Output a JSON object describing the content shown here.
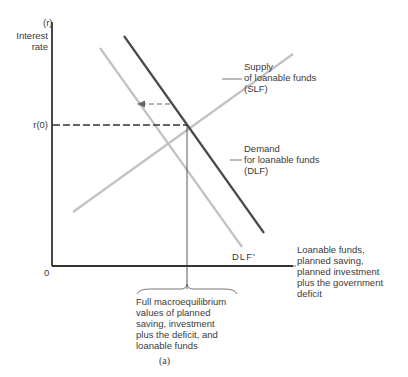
{
  "axes": {
    "y_symbol": "(r)",
    "y_label_line1": "Interest",
    "y_label_line2": "rate",
    "origin": "0",
    "x_label_lines": [
      "Loanable funds,",
      "planned saving,",
      "planned investment",
      "plus the government",
      "deficit"
    ],
    "r0_label": "r(0)"
  },
  "curves": {
    "supply": {
      "lines": [
        "Supply",
        "of loanable funds",
        "(SLF)"
      ]
    },
    "demand": {
      "lines": [
        "Demand",
        "for loanable funds",
        "(DLF)"
      ]
    },
    "demand_shifted": {
      "label": "DLF'"
    }
  },
  "annotation": {
    "lines": [
      "Full macroequilibrium",
      "values of planned",
      "saving, investment",
      "plus the deficit, and",
      "loanable funds"
    ]
  },
  "caption": "(a)",
  "colors": {
    "axis": "#333333",
    "dlf": "#4a4a4a",
    "light_curve": "#bdbdbd"
  }
}
